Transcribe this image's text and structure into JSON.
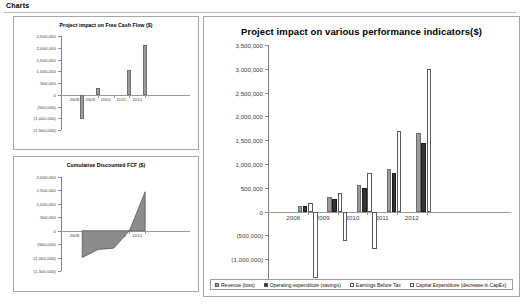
{
  "heading": "Charts",
  "chart_data": [
    {
      "id": "free-cash-flow",
      "type": "bar",
      "title": "Project impact on Free Cash Flow ($)",
      "xlabel": "",
      "ylabel": "",
      "categories": [
        "2008",
        "2009",
        "2010",
        "2011",
        "2012"
      ],
      "values": [
        -1050000,
        300000,
        0,
        1050000,
        2100000
      ],
      "ylim": [
        -1500000,
        2500000
      ],
      "yticks": [
        2500000,
        2000000,
        1500000,
        1000000,
        500000,
        0,
        -500000,
        -1000000,
        -1500000
      ],
      "ytick_labels": [
        "2,500,000",
        "2,000,000",
        "1,500,000",
        "1,000,000",
        "500,000",
        "0",
        "(500,000)",
        "(1,000,000)",
        "(1,500,000)"
      ],
      "grid": false,
      "legend": "none",
      "series": [
        {
          "name": "Free Cash Flow",
          "color": "#9b9b9b"
        }
      ]
    },
    {
      "id": "cumulative-discounted-fcf",
      "type": "area",
      "title": "Cumulative Discounted FCF ($)",
      "xlabel": "",
      "ylabel": "",
      "categories": [
        "2008",
        "2009",
        "2010",
        "2011",
        "2012"
      ],
      "x": [
        "2008",
        "2009",
        "2010",
        "2011",
        "2012"
      ],
      "values": [
        -1000000,
        -700000,
        -650000,
        0,
        1450000
      ],
      "ylim": [
        -1500000,
        2000000
      ],
      "yticks": [
        2000000,
        1500000,
        1000000,
        500000,
        0,
        -500000,
        -1000000,
        -1500000
      ],
      "ytick_labels": [
        "2,000,000",
        "1,500,000",
        "1,000,000",
        "500,000",
        "0",
        "(500,000)",
        "(1,000,000)",
        "(1,500,000)"
      ],
      "grid": false,
      "legend": "none",
      "series": [
        {
          "name": "Cumulative Discounted FCF",
          "color": "#8c8c8c"
        }
      ]
    },
    {
      "id": "performance-indicators",
      "type": "bar",
      "title": "Project impact on various performance indicators($)",
      "xlabel": "",
      "ylabel": "",
      "categories": [
        "2008",
        "2009",
        "2010",
        "2011",
        "2012"
      ],
      "ylim": [
        -1500000,
        3500000
      ],
      "yticks": [
        3500000,
        3000000,
        2500000,
        2000000,
        1500000,
        1000000,
        500000,
        0,
        -500000,
        -1000000,
        -1500000
      ],
      "ytick_labels": [
        "3,500,000",
        "3,000,000",
        "2,500,000",
        "2,000,000",
        "1,500,000",
        "1,000,000",
        "500,000",
        "0",
        "(500,000)",
        "(1,000,000)",
        "(1,500,000)"
      ],
      "grid": false,
      "legend": "bottom",
      "series": [
        {
          "name": "Revenue (loss)",
          "color": "#9b9b9b",
          "values": [
            120000,
            300000,
            560000,
            900000,
            1650000
          ]
        },
        {
          "name": "Operating expenditure (savings)",
          "color": "#343434",
          "values": [
            110000,
            260000,
            500000,
            820000,
            1450000
          ]
        },
        {
          "name": "Earnings Before Tax",
          "color": "#ffffff",
          "values": [
            180000,
            400000,
            820000,
            1700000,
            3000000
          ]
        },
        {
          "name": "Capital Expenditure (decrease in CapEx)",
          "color": "#ffffff",
          "values": [
            -1400000,
            -620000,
            -780000,
            0,
            0
          ]
        }
      ]
    }
  ],
  "legend": {
    "items": [
      {
        "label": "Revenue (loss)",
        "color": "#9b9b9b"
      },
      {
        "label": "Operating expenditure (savings)",
        "color": "#343434"
      },
      {
        "label": "Earnings Before Tax",
        "color": "#ffffff"
      },
      {
        "label": "Capital Expenditure (decrease in CapEx)",
        "color": "#ffffff"
      }
    ]
  }
}
